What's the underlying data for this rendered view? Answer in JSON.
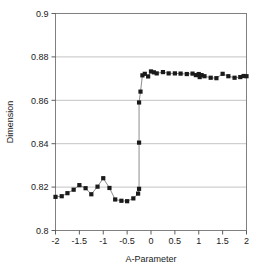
{
  "chart_data": {
    "type": "line",
    "title": "",
    "xlabel": "A-Parameter",
    "ylabel": "Dimension",
    "xlim": [
      -2,
      2
    ],
    "ylim": [
      0.8,
      0.9
    ],
    "xticks": [
      "-2",
      "-1.5",
      "-1",
      "-0.5",
      "0",
      "0.5",
      "1",
      "1.5",
      "2"
    ],
    "xtick_values": [
      -2,
      -1.5,
      -1,
      -0.5,
      0,
      0.5,
      1,
      1.5,
      2
    ],
    "yticks": [
      "0.8",
      "0.82",
      "0.84",
      "0.86",
      "0.88",
      "0.9"
    ],
    "ytick_values": [
      0.8,
      0.82,
      0.84,
      0.86,
      0.88,
      0.9
    ],
    "grid": "horizontal",
    "legend": "none",
    "marker": "square",
    "marker_color": "#1a1a1a",
    "line_color": "#808080",
    "frame_color": "#808080",
    "series": [
      {
        "name": "Dimension vs A-Parameter",
        "x": [
          -2.0,
          -1.87,
          -1.75,
          -1.62,
          -1.5,
          -1.37,
          -1.25,
          -1.12,
          -1.0,
          -0.87,
          -0.75,
          -0.62,
          -0.5,
          -0.37,
          -0.27,
          -0.25,
          -0.25,
          -0.25,
          -0.22,
          -0.18,
          -0.13,
          -0.06,
          0.0,
          0.06,
          0.12,
          0.25,
          0.37,
          0.5,
          0.62,
          0.75,
          0.87,
          0.94,
          1.0,
          1.02,
          1.06,
          1.12,
          1.25,
          1.37,
          1.5,
          1.62,
          1.75,
          1.87,
          1.94,
          2.0
        ],
        "y": [
          0.8155,
          0.8158,
          0.8172,
          0.8188,
          0.8209,
          0.8195,
          0.8167,
          0.8202,
          0.8241,
          0.8196,
          0.8143,
          0.8137,
          0.8135,
          0.8148,
          0.817,
          0.8192,
          0.8405,
          0.859,
          0.864,
          0.8715,
          0.8722,
          0.871,
          0.8733,
          0.8729,
          0.8724,
          0.873,
          0.8724,
          0.8724,
          0.8723,
          0.8721,
          0.8723,
          0.8716,
          0.8721,
          0.8707,
          0.8716,
          0.8711,
          0.8704,
          0.8702,
          0.8722,
          0.8711,
          0.8704,
          0.8707,
          0.8712,
          0.8711
        ]
      }
    ]
  },
  "axes": {
    "x_label": "A-Parameter",
    "y_label": "Dimension"
  }
}
